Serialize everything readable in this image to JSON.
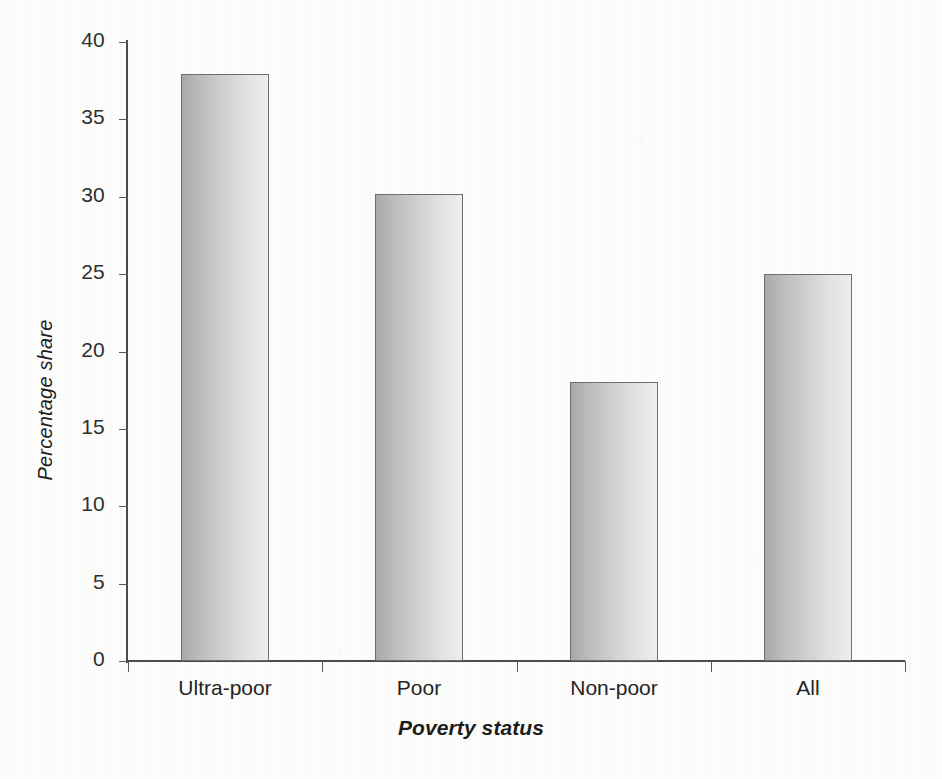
{
  "chart_data": {
    "type": "bar",
    "title": "",
    "subtitle": "",
    "categories": [
      "Ultra-poor",
      "Poor",
      "Non-poor",
      "All"
    ],
    "values": [
      37.9,
      30.2,
      18.0,
      25.0
    ],
    "xlabel": "Poverty status",
    "ylabel": "Percentage share",
    "ylim": [
      0,
      40
    ],
    "yticks": [
      0,
      5,
      10,
      15,
      20,
      25,
      30,
      35,
      40
    ],
    "ytick_labels": [
      "0",
      "5",
      "10",
      "15",
      "20",
      "25",
      "30",
      "35",
      "40"
    ],
    "grid": false,
    "legend": null,
    "legend_position": "none",
    "annotations": [],
    "series": [
      {
        "name": "Percentage share",
        "values": [
          37.9,
          30.2,
          18.0,
          25.0
        ]
      }
    ]
  },
  "style": {
    "bar_fill_dark": "#a9a9a9",
    "bar_fill_light": "#ededed",
    "bar_border": "#6e6e6e",
    "axis_color": "#4a4a4a",
    "text_color": "#252525",
    "background": "#fdfdfc"
  }
}
